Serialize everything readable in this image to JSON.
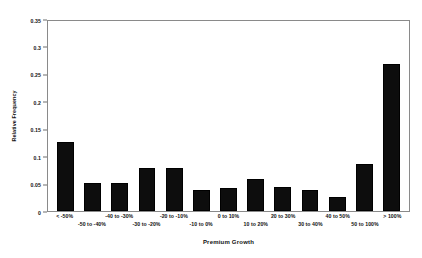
{
  "chart_data": {
    "type": "bar",
    "title": "",
    "xlabel": "Premium Growth",
    "ylabel": "Relative Frequency",
    "ylim": [
      0,
      0.35
    ],
    "yticks": [
      "0",
      "0.05",
      "0.1",
      "0.15",
      "0.2",
      "0.25",
      "0.3",
      "0.35"
    ],
    "ytick_values": [
      0,
      0.05,
      0.1,
      0.15,
      0.2,
      0.25,
      0.3,
      0.35
    ],
    "grid": false,
    "legend": "none",
    "bar_color": "#0d0d0d",
    "frame_color": "#8a8a8a",
    "categories": [
      "< -50%",
      "-50 to -40%",
      "-40 to -30%",
      "-30 to -20%",
      "-20 to -10%",
      "-10 to 0%",
      "0 to 10%",
      "10 to 20%",
      "20 to 30%",
      "30 to 40%",
      "40 to 50%",
      "50 to 100%",
      "> 100%"
    ],
    "values": [
      0.126,
      0.051,
      0.051,
      0.079,
      0.079,
      0.039,
      0.042,
      0.058,
      0.043,
      0.039,
      0.025,
      0.086,
      0.268
    ]
  }
}
